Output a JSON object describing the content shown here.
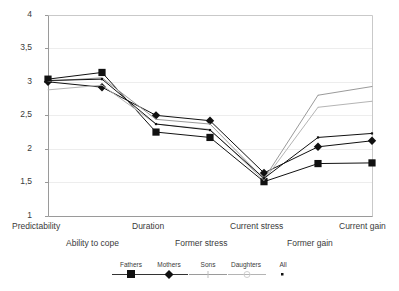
{
  "chart_data": {
    "type": "line",
    "title": "",
    "xlabel": "",
    "ylabel": "",
    "ylim": [
      1,
      4
    ],
    "ytick_labels": [
      "1",
      "1,5",
      "2",
      "2,5",
      "3",
      "3,5",
      "4"
    ],
    "ytick_values": [
      1,
      1.5,
      2,
      2.5,
      3,
      3.5,
      4
    ],
    "grid": true,
    "legend_position": "bottom",
    "categories": [
      "Predictability",
      "Ability to cope",
      "Duration",
      "Former stress",
      "Current stress",
      "Former gain",
      "Current gain"
    ],
    "series": [
      {
        "name": "Fathers",
        "marker": "square",
        "color": "#111111",
        "values": [
          3.05,
          3.15,
          2.26,
          2.18,
          1.52,
          1.79,
          1.8
        ]
      },
      {
        "name": "Mothers",
        "marker": "diamond",
        "color": "#111111",
        "values": [
          3.01,
          2.93,
          2.51,
          2.43,
          1.65,
          2.04,
          2.13
        ]
      },
      {
        "name": "Sons",
        "marker": "line",
        "color": "#9a9a9a",
        "values": [
          3.02,
          3.07,
          2.45,
          2.38,
          1.56,
          2.81,
          2.94
        ]
      },
      {
        "name": "Daughters",
        "marker": "line",
        "color": "#b4b4b4",
        "values": [
          2.89,
          2.96,
          2.38,
          2.3,
          1.54,
          2.63,
          2.72
        ]
      },
      {
        "name": "All",
        "marker": "dot",
        "color": "#111111",
        "values": [
          3.03,
          3.05,
          2.38,
          2.29,
          1.57,
          2.18,
          2.24
        ]
      }
    ]
  },
  "legend": {
    "items": [
      {
        "label": "Fathers"
      },
      {
        "label": "Mothers"
      },
      {
        "label": "Sons"
      },
      {
        "label": "Daughters"
      },
      {
        "label": "All"
      }
    ]
  },
  "axis": {
    "x_row_top": [
      "Predictability",
      "Duration",
      "Current stress",
      "Current gain"
    ],
    "x_row_bottom": [
      "Ability to cope",
      "Former stress",
      "Former gain"
    ]
  }
}
